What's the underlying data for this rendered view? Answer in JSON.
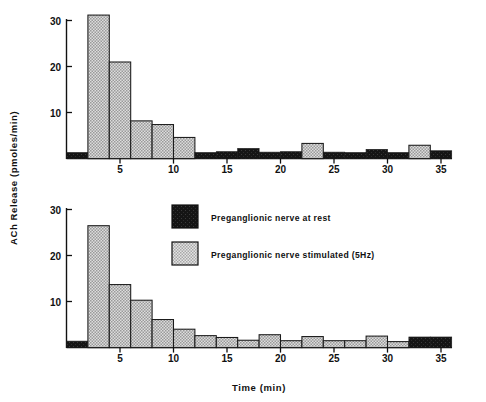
{
  "figure": {
    "background": "#ffffff",
    "axis_color": "#111111"
  },
  "axes": {
    "ylabel": "ACh Release (pmoles/min)",
    "xlabel": "Time (min)",
    "yticks": [
      "10",
      "20",
      "30"
    ],
    "xticks": [
      "5",
      "10",
      "15",
      "20",
      "25",
      "30",
      "35"
    ]
  },
  "legend": {
    "position": "center",
    "items": [
      {
        "label": "Preganglionic nerve at rest",
        "swatch": "rest",
        "color": "#1a1a1a"
      },
      {
        "label": "Preganglionic nerve stimulated (5Hz)",
        "swatch": "stimulated",
        "color": "#d0d0d0"
      }
    ]
  },
  "colors": {
    "rest": "#1a1a1a",
    "stimulated": "#d2d2d2",
    "outline": "#1a1a1a"
  },
  "chart_data": [
    {
      "id": "upper",
      "type": "bar",
      "title": "",
      "xlabel": "",
      "ylabel": "ACh Release (pmoles/min)",
      "xlim": [
        0,
        36
      ],
      "ylim": [
        0,
        32
      ],
      "yticks": [
        10,
        20,
        30
      ],
      "xticks": [
        5,
        10,
        15,
        20,
        25,
        30,
        35
      ],
      "grid": false,
      "bin_width": 2,
      "bins": [
        {
          "start": 0,
          "end": 2,
          "value": 1.3,
          "state": "rest"
        },
        {
          "start": 2,
          "end": 4,
          "value": 31.2,
          "state": "stimulated"
        },
        {
          "start": 4,
          "end": 6,
          "value": 21.0,
          "state": "stimulated"
        },
        {
          "start": 6,
          "end": 8,
          "value": 8.2,
          "state": "stimulated"
        },
        {
          "start": 8,
          "end": 10,
          "value": 7.4,
          "state": "stimulated"
        },
        {
          "start": 10,
          "end": 12,
          "value": 4.6,
          "state": "stimulated"
        },
        {
          "start": 12,
          "end": 14,
          "value": 1.3,
          "state": "rest"
        },
        {
          "start": 14,
          "end": 16,
          "value": 1.5,
          "state": "rest"
        },
        {
          "start": 16,
          "end": 18,
          "value": 2.2,
          "state": "rest"
        },
        {
          "start": 18,
          "end": 20,
          "value": 1.4,
          "state": "rest"
        },
        {
          "start": 20,
          "end": 22,
          "value": 1.5,
          "state": "rest"
        },
        {
          "start": 22,
          "end": 24,
          "value": 3.3,
          "state": "stimulated"
        },
        {
          "start": 24,
          "end": 26,
          "value": 1.4,
          "state": "rest"
        },
        {
          "start": 26,
          "end": 28,
          "value": 1.3,
          "state": "rest"
        },
        {
          "start": 28,
          "end": 30,
          "value": 2.0,
          "state": "rest"
        },
        {
          "start": 30,
          "end": 32,
          "value": 1.3,
          "state": "rest"
        },
        {
          "start": 32,
          "end": 34,
          "value": 2.9,
          "state": "stimulated"
        },
        {
          "start": 34,
          "end": 36,
          "value": 1.7,
          "state": "rest"
        }
      ]
    },
    {
      "id": "lower",
      "type": "bar",
      "title": "",
      "xlabel": "Time (min)",
      "ylabel": "ACh Release (pmoles/min)",
      "xlim": [
        0,
        36
      ],
      "ylim": [
        0,
        32
      ],
      "yticks": [
        10,
        20,
        30
      ],
      "xticks": [
        5,
        10,
        15,
        20,
        25,
        30,
        35
      ],
      "grid": false,
      "bin_width": 2,
      "bins": [
        {
          "start": 0,
          "end": 2,
          "value": 1.4,
          "state": "rest"
        },
        {
          "start": 2,
          "end": 4,
          "value": 26.5,
          "state": "stimulated"
        },
        {
          "start": 4,
          "end": 6,
          "value": 13.7,
          "state": "stimulated"
        },
        {
          "start": 6,
          "end": 8,
          "value": 10.3,
          "state": "stimulated"
        },
        {
          "start": 8,
          "end": 10,
          "value": 6.1,
          "state": "stimulated"
        },
        {
          "start": 10,
          "end": 12,
          "value": 4.0,
          "state": "stimulated"
        },
        {
          "start": 12,
          "end": 14,
          "value": 2.6,
          "state": "stimulated"
        },
        {
          "start": 14,
          "end": 16,
          "value": 2.2,
          "state": "stimulated"
        },
        {
          "start": 16,
          "end": 18,
          "value": 1.6,
          "state": "stimulated"
        },
        {
          "start": 18,
          "end": 20,
          "value": 2.8,
          "state": "stimulated"
        },
        {
          "start": 20,
          "end": 22,
          "value": 1.5,
          "state": "stimulated"
        },
        {
          "start": 22,
          "end": 24,
          "value": 2.4,
          "state": "stimulated"
        },
        {
          "start": 24,
          "end": 26,
          "value": 1.5,
          "state": "stimulated"
        },
        {
          "start": 26,
          "end": 28,
          "value": 1.5,
          "state": "stimulated"
        },
        {
          "start": 28,
          "end": 30,
          "value": 2.5,
          "state": "stimulated"
        },
        {
          "start": 30,
          "end": 32,
          "value": 1.3,
          "state": "stimulated"
        },
        {
          "start": 32,
          "end": 34,
          "value": 2.3,
          "state": "rest"
        },
        {
          "start": 34,
          "end": 36,
          "value": 2.3,
          "state": "rest"
        }
      ]
    }
  ]
}
